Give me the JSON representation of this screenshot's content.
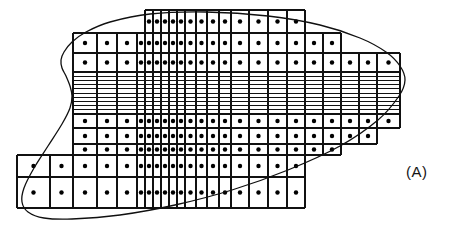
{
  "figure": {
    "panel_label": "(A)",
    "caption_visible_text": "(A)",
    "background_color": "#ffffff",
    "line_color": "#101010",
    "node_color": "#000000",
    "boundary_color": "#101010",
    "width_px": 450,
    "height_px": 238
  },
  "chart_data": {
    "type": "scatter",
    "title": "",
    "subtitle": "",
    "xlabel": "",
    "ylabel": "",
    "annotations": [
      "(A)"
    ],
    "legend": [],
    "grid": true,
    "xlim": [
      0,
      450
    ],
    "ylim": [
      0,
      238
    ],
    "mesh": {
      "vertical_grid_lines_x": [
        17,
        50,
        73,
        97,
        117,
        137,
        145,
        153,
        161,
        169,
        177,
        185,
        196,
        207,
        219,
        231,
        249,
        268,
        287,
        305,
        323,
        341,
        359,
        377,
        400
      ],
      "horizontal_grid_lines_y": [
        10,
        33,
        53,
        72,
        79,
        83,
        87,
        91,
        95,
        99,
        103,
        107,
        114,
        128,
        144,
        155,
        177,
        208
      ],
      "dense_band": {
        "y_top": 72,
        "y_bottom": 114,
        "thin_row_count": 10,
        "note": "closely spaced horizontal lines producing thin high-aspect-ratio cells"
      },
      "row_spans": [
        {
          "row": 1,
          "y_top": 10,
          "y_bottom": 33,
          "x_left": 145,
          "x_right": 305
        },
        {
          "row": 2,
          "y_top": 33,
          "y_bottom": 53,
          "x_left": 73,
          "x_right": 341
        },
        {
          "row": 3,
          "y_top": 53,
          "y_bottom": 72,
          "x_left": 73,
          "x_right": 400
        },
        {
          "row": 4,
          "y_top": 72,
          "y_bottom": 114,
          "x_left": 73,
          "x_right": 400
        },
        {
          "row": 5,
          "y_top": 114,
          "y_bottom": 128,
          "x_left": 73,
          "x_right": 400
        },
        {
          "row": 6,
          "y_top": 128,
          "y_bottom": 144,
          "x_left": 73,
          "x_right": 377
        },
        {
          "row": 7,
          "y_top": 144,
          "y_bottom": 155,
          "x_left": 73,
          "x_right": 341
        },
        {
          "row": 8,
          "y_top": 155,
          "y_bottom": 177,
          "x_left": 17,
          "x_right": 305
        },
        {
          "row": 9,
          "y_top": 177,
          "y_bottom": 208,
          "x_left": 17,
          "x_right": 305
        }
      ],
      "node_marker": {
        "shape": "filled-circle",
        "radius_px": 2.2,
        "placement": "cell-center"
      },
      "total_nodes_approx": 196
    },
    "boundary_curve": {
      "closed": true,
      "stroke_width_px": 1.3,
      "points": [
        [
          206,
          12
        ],
        [
          150,
          14
        ],
        [
          110,
          22
        ],
        [
          86,
          32
        ],
        [
          72,
          42
        ],
        [
          64,
          52
        ],
        [
          61,
          60
        ],
        [
          62,
          68
        ],
        [
          66,
          76
        ],
        [
          70,
          86
        ],
        [
          72,
          96
        ],
        [
          70,
          108
        ],
        [
          62,
          124
        ],
        [
          48,
          146
        ],
        [
          34,
          168
        ],
        [
          24,
          188
        ],
        [
          22,
          202
        ],
        [
          28,
          212
        ],
        [
          44,
          218
        ],
        [
          72,
          219
        ],
        [
          120,
          215
        ],
        [
          175,
          205
        ],
        [
          232,
          190
        ],
        [
          288,
          170
        ],
        [
          340,
          146
        ],
        [
          378,
          120
        ],
        [
          399,
          96
        ],
        [
          405,
          80
        ],
        [
          400,
          66
        ],
        [
          386,
          52
        ],
        [
          360,
          38
        ],
        [
          320,
          25
        ],
        [
          268,
          16
        ],
        [
          206,
          12
        ]
      ]
    }
  }
}
